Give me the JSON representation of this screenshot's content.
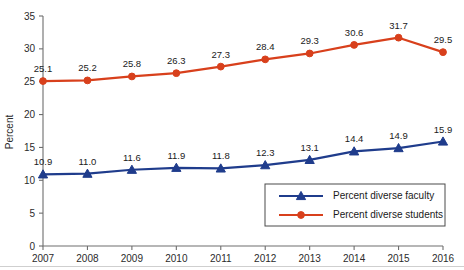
{
  "chart_data": {
    "type": "line",
    "title": "",
    "xlabel": "",
    "ylabel": "Percent",
    "categories": [
      "2007",
      "2008",
      "2009",
      "2010",
      "2011",
      "2012",
      "2013",
      "2014",
      "2015",
      "2016"
    ],
    "x": [
      2007,
      2008,
      2009,
      2010,
      2011,
      2012,
      2013,
      2014,
      2015,
      2016
    ],
    "ylim": [
      0,
      35
    ],
    "yticks": [
      0,
      5,
      10,
      15,
      20,
      25,
      30,
      35
    ],
    "ytick_labels": [
      "0",
      "5",
      "10",
      "15",
      "20",
      "25",
      "30",
      "35"
    ],
    "grid": false,
    "legend_position": "bottom-right",
    "series": [
      {
        "name": "Percent diverse faculty",
        "color": "#1F3C8C",
        "marker": "triangle",
        "values": [
          10.9,
          11.0,
          11.6,
          11.9,
          11.8,
          12.3,
          13.1,
          14.4,
          14.9,
          15.9
        ],
        "labels": [
          "10.9",
          "11.0",
          "11.6",
          "11.9",
          "11.8",
          "12.3",
          "13.1",
          "14.4",
          "14.9",
          "15.9"
        ]
      },
      {
        "name": "Percent diverse students",
        "color": "#D8401C",
        "marker": "circle",
        "values": [
          25.1,
          25.2,
          25.8,
          26.3,
          27.3,
          28.4,
          29.3,
          30.6,
          31.7,
          29.5
        ],
        "labels": [
          "25.1",
          "25.2",
          "25.8",
          "26.3",
          "27.3",
          "28.4",
          "29.3",
          "30.6",
          "31.7",
          "29.5"
        ]
      }
    ]
  },
  "legend": {
    "items": [
      {
        "label": "Percent diverse faculty",
        "color": "#1F3C8C",
        "marker": "triangle"
      },
      {
        "label": "Percent diverse students",
        "color": "#D8401C",
        "marker": "circle"
      }
    ]
  },
  "colors": {
    "faculty": "#1F3C8C",
    "students": "#D8401C",
    "axis": "#6e6e6e",
    "text": "#1a1a1a",
    "background": "#ffffff"
  }
}
